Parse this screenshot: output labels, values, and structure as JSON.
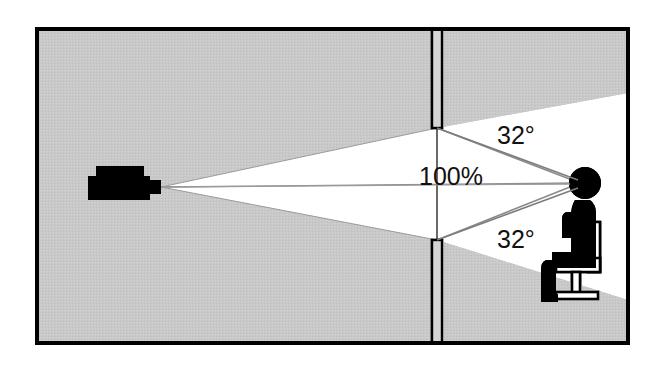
{
  "diagram": {
    "canvas": {
      "width": 659,
      "height": 366
    },
    "colors": {
      "background": "#ffffff",
      "room_fill": "#c9c9c9",
      "light_beam": "#ffffff",
      "outline": "#000000",
      "silhouette": "#000000",
      "sight_line": "#8a8a8a",
      "label_text": "#111111"
    },
    "frame": {
      "x": 35,
      "y": 27,
      "width": 595,
      "height": 318,
      "stroke_width": 4
    },
    "screen_wall": {
      "x": 437,
      "top_segment": {
        "y_start": 27,
        "y_end": 128
      },
      "bottom_segment": {
        "y_start": 240,
        "y_end": 345
      },
      "gap_top_y": 128,
      "gap_bottom_y": 240
    },
    "projector": {
      "body": {
        "x": 88,
        "y": 176,
        "width": 62,
        "height": 24
      },
      "top_box": {
        "x": 96,
        "y": 166,
        "width": 48,
        "height": 11
      },
      "lens": {
        "x": 150,
        "y": 180,
        "width": 11,
        "height": 14
      },
      "apex": {
        "x": 161,
        "y": 187
      }
    },
    "viewer": {
      "head": {
        "cx": 585,
        "cy": 183,
        "r": 16
      },
      "eye_point": {
        "x": 578,
        "y": 183
      }
    },
    "labels": {
      "angle_top": {
        "text": "32°",
        "x": 497,
        "y": 144,
        "font_size": 25
      },
      "center_percent": {
        "text": "100%",
        "x": 483,
        "y": 185,
        "font_size": 25
      },
      "angle_bottom": {
        "text": "32°",
        "x": 497,
        "y": 248,
        "font_size": 25
      }
    },
    "measurements": {
      "upper_viewing_angle": "32°",
      "lower_viewing_angle": "32°",
      "image_coverage": "100%"
    }
  }
}
